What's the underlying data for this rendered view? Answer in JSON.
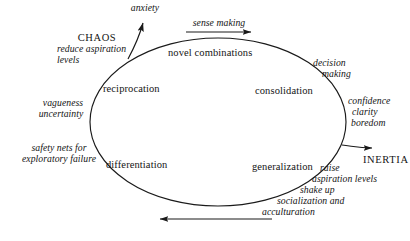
{
  "diagram": {
    "stroke_color": "#1a1a1a",
    "background_color": "#ffffff",
    "poles": {
      "chaos": "CHAOS",
      "inertia": "INERTIA"
    },
    "stages": [
      {
        "id": "novel-combinations",
        "label": "novel combinations"
      },
      {
        "id": "consolidation",
        "label": "consolidation"
      },
      {
        "id": "generalization",
        "label": "generalization"
      },
      {
        "id": "differentiation",
        "label": "differentiation"
      },
      {
        "id": "reciprocation",
        "label": "reciprocation"
      }
    ],
    "annotations": [
      {
        "id": "anxiety",
        "label": "anxiety"
      },
      {
        "id": "sense-making",
        "label": "sense making"
      },
      {
        "id": "reduce-aspiration-levels",
        "line1": "reduce aspiration",
        "line2": "levels"
      },
      {
        "id": "vagueness-uncertainty",
        "line1": "vagueness",
        "line2": "uncertainty"
      },
      {
        "id": "safety-nets",
        "line1": "safety nets for",
        "line2": "exploratory failure"
      },
      {
        "id": "decision-making",
        "line1": "decision",
        "line2": "making"
      },
      {
        "id": "confidence-clarity-boredom",
        "line1": "confidence",
        "line2": "clarity",
        "line3": "boredom"
      },
      {
        "id": "raise-aspiration",
        "line1": "raise",
        "line2": "aspiration levels",
        "line3": "shake up",
        "line4": "socialization and",
        "line5": "acculturation"
      }
    ],
    "arrows": [
      {
        "id": "anxiety-arrow",
        "direction": "up",
        "target": "anxiety"
      },
      {
        "id": "sense-making-arrow",
        "direction": "right",
        "target": "sense making"
      },
      {
        "id": "inertia-arrow",
        "direction": "right",
        "target": "INERTIA"
      },
      {
        "id": "return-arrow",
        "direction": "left",
        "target": "bottom return path"
      }
    ]
  }
}
